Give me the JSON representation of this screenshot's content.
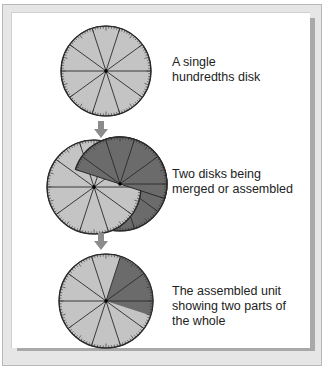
{
  "figure": {
    "steps": [
      {
        "id": "single",
        "caption_lines": [
          "A single",
          "hundredths disk"
        ],
        "disks": [
          {
            "role": "light",
            "divisions": 10,
            "ticks": 100,
            "dark_fraction": 0
          }
        ]
      },
      {
        "id": "merge",
        "caption_lines": [
          "Two disks being",
          "merged or assembled"
        ],
        "disks": [
          {
            "role": "dark-behind",
            "divisions": 10,
            "ticks": 100
          },
          {
            "role": "light-front",
            "divisions": 10,
            "ticks": 100
          }
        ]
      },
      {
        "id": "assembled",
        "caption_lines": [
          "The assembled unit",
          "showing two parts of",
          "the whole"
        ],
        "disks": [
          {
            "role": "assembled",
            "divisions": 10,
            "ticks": 100,
            "dark_start_fraction": 0.05,
            "dark_end_fraction": 0.3
          }
        ]
      }
    ],
    "arrows": [
      {
        "from": "single",
        "to": "merge",
        "icon": "down-arrow-icon"
      },
      {
        "from": "merge",
        "to": "assembled",
        "icon": "down-arrow-icon"
      }
    ],
    "colors": {
      "light_disk": "#c4c4c4",
      "dark_disk": "#6b6b6b",
      "line": "#2a2a2a",
      "arrow": "#8c8c8c"
    }
  }
}
